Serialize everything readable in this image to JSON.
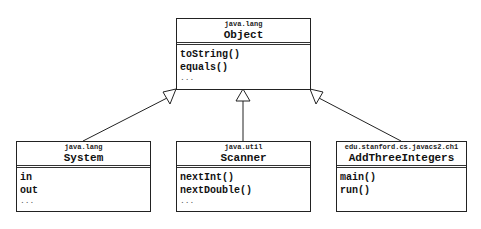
{
  "diagram": {
    "type": "uml-class-diagram",
    "relationship": "generalization",
    "parent": {
      "package": "java.lang",
      "name": "Object",
      "members": [
        "toString()",
        "equals()"
      ],
      "ellipsis": "..."
    },
    "children": [
      {
        "package": "java.lang",
        "name": "System",
        "members": [
          "in",
          "out"
        ],
        "ellipsis": "..."
      },
      {
        "package": "java.util",
        "name": "Scanner",
        "members": [
          "nextInt()",
          "nextDouble()"
        ],
        "ellipsis": "..."
      },
      {
        "package": "edu.stanford.cs.javacs2.ch1",
        "name": "AddThreeIntegers",
        "members": [
          "main()",
          "run()"
        ],
        "ellipsis": ""
      }
    ]
  }
}
